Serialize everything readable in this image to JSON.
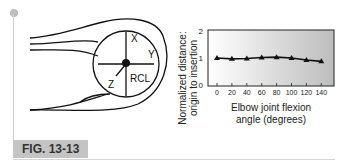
{
  "figure": {
    "label": "FIG. 13-13",
    "diagram": {
      "axis_labels": {
        "x": "X",
        "y": "Y",
        "z": "Z",
        "center": "RCL"
      }
    }
  },
  "chart_data": {
    "type": "line",
    "title": "",
    "xlabel": "Elbow joint flexion angle (degrees)",
    "xlabel_lines": [
      "Elbow joint flexion",
      "angle (degrees)"
    ],
    "ylabel": "Normalized distance: origin to insertion",
    "ylabel_lines": [
      "Normalized distance:",
      "origin to insertion"
    ],
    "x": [
      0,
      20,
      40,
      60,
      80,
      100,
      120,
      140
    ],
    "values": [
      1.0,
      0.97,
      0.98,
      1.02,
      1.03,
      1.0,
      0.93,
      0.88
    ],
    "x_ticks": [
      "0",
      "20",
      "40",
      "60",
      "80",
      "100",
      "120",
      "140"
    ],
    "y_ticks": [
      "0",
      "1",
      "2"
    ],
    "ylim": [
      0,
      2
    ],
    "marker": "triangle",
    "grid": false,
    "legend": null,
    "background": "gradient white-to-gray"
  }
}
